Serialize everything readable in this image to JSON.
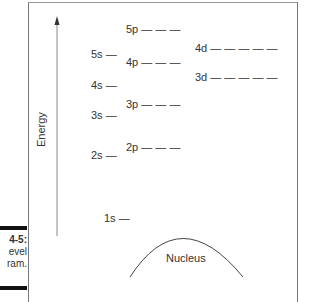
{
  "figure": {
    "caption_number": "4-5:",
    "caption_lines": [
      "evel",
      "ram."
    ],
    "axis_label": "Energy",
    "nucleus_label": "Nucleus"
  },
  "levels": {
    "s": [
      {
        "label": "1s —",
        "y": 218
      },
      {
        "label": "2s —",
        "y": 126
      },
      {
        "label": "3s —",
        "y": 113
      },
      {
        "label": "4s —",
        "y": 84
      },
      {
        "label": "5s —",
        "y": 53
      }
    ],
    "p": [
      {
        "label": "2p — — —",
        "y": 146
      },
      {
        "label": "3p — — —",
        "y": 103
      },
      {
        "label": "4p — — —",
        "y": 61
      },
      {
        "label": "5p — — —",
        "y": 28
      }
    ],
    "d": [
      {
        "label": "3d — — — — —",
        "y": 76
      },
      {
        "label": "4d — — — — —",
        "y": 47
      }
    ]
  }
}
